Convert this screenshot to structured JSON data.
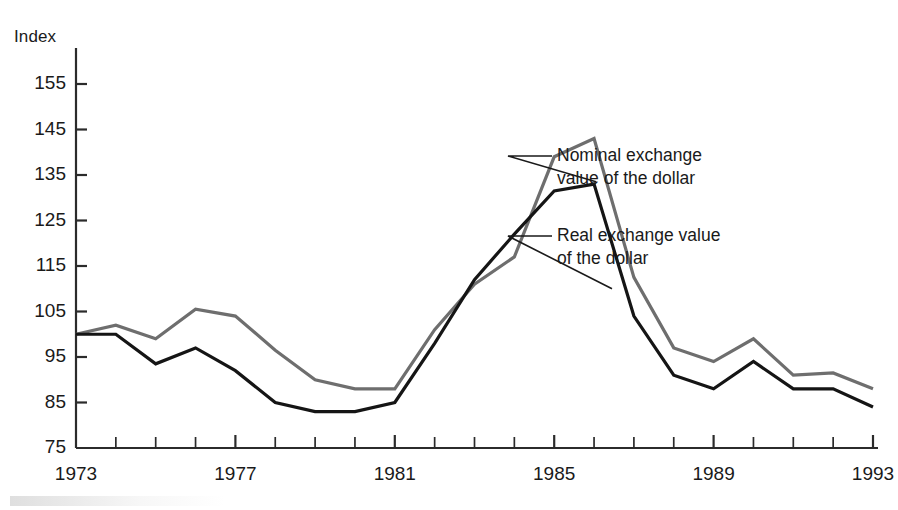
{
  "chart_data": {
    "type": "line",
    "title": "",
    "subtitle": "",
    "ylabel": "Index",
    "xlabel": "",
    "grid": false,
    "legend_position": "inline-annotations",
    "ylim": [
      75,
      155
    ],
    "xlim": [
      1973,
      1993
    ],
    "ytick_labels": [
      "155",
      "145",
      "135",
      "125",
      "115",
      "105",
      "95",
      "85",
      "75"
    ],
    "ytick_values": [
      155,
      145,
      135,
      125,
      115,
      105,
      95,
      85,
      75
    ],
    "xtick_labels": [
      "1973",
      "1977",
      "1981",
      "1985",
      "1989",
      "1993"
    ],
    "xtick_values": [
      1973,
      1977,
      1981,
      1985,
      1989,
      1993
    ],
    "x_minor_ticks": [
      1973,
      1974,
      1975,
      1976,
      1977,
      1978,
      1979,
      1980,
      1981,
      1982,
      1983,
      1984,
      1985,
      1986,
      1987,
      1988,
      1989,
      1990,
      1991,
      1992,
      1993
    ],
    "x": [
      1973,
      1974,
      1975,
      1976,
      1977,
      1978,
      1979,
      1980,
      1981,
      1982,
      1983,
      1984,
      1985,
      1986,
      1987,
      1988,
      1989,
      1990,
      1991,
      1992,
      1993
    ],
    "series": [
      {
        "name": "Nominal exchange value of the dollar",
        "color": "#6e6e6e",
        "width": 3.2,
        "values": [
          100.0,
          102.0,
          99.0,
          105.5,
          104.0,
          96.5,
          90.0,
          88.0,
          88.0,
          101.0,
          111.0,
          117.0,
          139.0,
          143.0,
          112.5,
          97.0,
          94.0,
          99.0,
          91.0,
          91.5,
          88.0
        ]
      },
      {
        "name": "Real exchange value of the dollar",
        "color": "#151515",
        "width": 3.2,
        "values": [
          100.0,
          100.0,
          93.5,
          97.0,
          92.0,
          85.0,
          83.0,
          83.0,
          85.0,
          98.0,
          112.0,
          122.0,
          131.5,
          133.0,
          104.0,
          91.0,
          88.0,
          94.0,
          88.0,
          88.0,
          84.0
        ]
      }
    ],
    "annotations": [
      {
        "id": "nominal-annotation",
        "line1": "Nominal exchange",
        "line2": "value of the dollar",
        "target_year": 1986,
        "target_value": 132
      },
      {
        "id": "real-annotation",
        "line1": "Real exchange value",
        "line2": "of the dollar",
        "target_year": 1986.35,
        "target_value": 112
      }
    ]
  },
  "axis": {
    "y_title": "Index"
  }
}
